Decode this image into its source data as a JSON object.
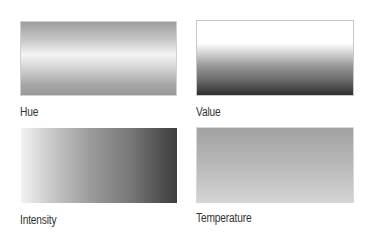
{
  "panels": [
    {
      "label": "Hue",
      "gradient": "vertical: mid-gray top, white band center, mid-gray bottom"
    },
    {
      "label": "Value",
      "gradient": "vertical: white top to dark gray bottom"
    },
    {
      "label": "Intensity",
      "gradient": "horizontal: light gray left to dark gray right"
    },
    {
      "label": "Temperature",
      "gradient": "vertical: medium gray top to light gray bottom"
    }
  ]
}
